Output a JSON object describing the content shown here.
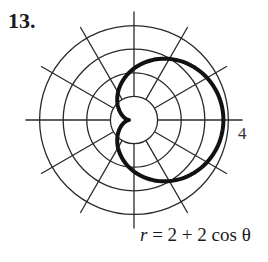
{
  "problem_number": "13.",
  "equation": {
    "lhs": "r",
    "rhs": "= 2 + 2 cos θ",
    "full": "r = 2 + 2 cos θ"
  },
  "axis_label": "4",
  "polar_grid": {
    "rings": [
      1,
      2,
      3,
      4
    ],
    "ray_angles_deg": [
      0,
      30,
      60,
      90,
      120,
      150,
      180,
      210,
      240,
      270,
      300,
      330
    ],
    "max_label": "4"
  },
  "curve": {
    "type": "cardioid",
    "a": 2,
    "b": 2,
    "function": "cos",
    "stroke": "#111111"
  },
  "chart_data": {
    "type": "polar",
    "title": "r = 2 + 2 cos θ",
    "rlim": [
      0,
      4
    ],
    "r_ticks": [
      1,
      2,
      3,
      4
    ],
    "theta_ticks_deg": [
      0,
      30,
      60,
      90,
      120,
      150,
      180,
      210,
      240,
      270,
      300,
      330
    ],
    "series": [
      {
        "name": "r = 2 + 2 cos θ",
        "theta_deg": [
          0,
          30,
          60,
          90,
          120,
          150,
          180,
          210,
          240,
          270,
          300,
          330,
          360
        ],
        "r": [
          4,
          3.73,
          3,
          2,
          1,
          0.27,
          0,
          0.27,
          1,
          2,
          3,
          3.73,
          4
        ]
      }
    ]
  }
}
